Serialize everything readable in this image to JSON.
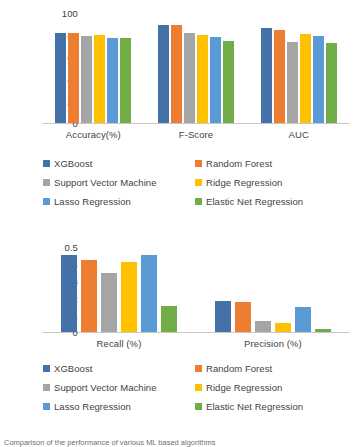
{
  "series_names": [
    "XGBoost",
    "Random Forest",
    "Support Vector Machine",
    "Ridge Regression",
    "Lasso Regression",
    "Elastic Net Regression"
  ],
  "colors": {
    "xgboost": "#4472a8",
    "random_forest": "#ed7d31",
    "support_vector_machine": "#a5a5a5",
    "ridge_regression": "#ffc000",
    "lasso_regression": "#5b9bd5",
    "elastic_net_regression": "#70ad47"
  },
  "caption": {
    "text": "Comparison of the performance of various ML based algorithms"
  },
  "chart_data": [
    {
      "type": "bar",
      "title": "",
      "xlabel": "",
      "ylabel": "",
      "ylim": [
        0,
        100
      ],
      "yticks": [
        "0",
        "20",
        "40",
        "60",
        "80",
        "100"
      ],
      "ytick_values": [
        0,
        20,
        40,
        60,
        80,
        100
      ],
      "grid": false,
      "legend_position": "bottom",
      "categories": [
        "Accuracy(%)",
        "F-Score",
        "AUC"
      ],
      "series": [
        {
          "name": "XGBoost",
          "color": "#4472a8",
          "values": [
            82,
            89.5,
            86.5
          ]
        },
        {
          "name": "Random Forest",
          "color": "#ed7d31",
          "values": [
            82,
            89,
            85
          ]
        },
        {
          "name": "Support Vector Machine",
          "color": "#a5a5a5",
          "values": [
            79,
            81.5,
            74
          ]
        },
        {
          "name": "Ridge Regression",
          "color": "#ffc000",
          "values": [
            80,
            80,
            80.5
          ]
        },
        {
          "name": "Lasso Regression",
          "color": "#5b9bd5",
          "values": [
            77,
            78.5,
            79.5
          ]
        },
        {
          "name": "Elastic Net Regression",
          "color": "#70ad47",
          "values": [
            77,
            75,
            72.5
          ]
        }
      ]
    },
    {
      "type": "bar",
      "title": "",
      "xlabel": "",
      "ylabel": "",
      "ylim": [
        0,
        0.5
      ],
      "yticks": [
        "0",
        "0.1",
        "0.2",
        "0.3",
        "0.4",
        "0.5"
      ],
      "ytick_values": [
        0,
        0.1,
        0.2,
        0.3,
        0.4,
        0.5
      ],
      "grid": false,
      "legend_position": "bottom",
      "categories": [
        "Recall (%)",
        "Precision (%)"
      ],
      "series": [
        {
          "name": "XGBoost",
          "color": "#4472a8",
          "values": [
            0.455,
            0.18
          ]
        },
        {
          "name": "Random Forest",
          "color": "#ed7d31",
          "values": [
            0.425,
            0.175
          ]
        },
        {
          "name": "Support Vector Machine",
          "color": "#a5a5a5",
          "values": [
            0.35,
            0.065
          ]
        },
        {
          "name": "Ridge Regression",
          "color": "#ffc000",
          "values": [
            0.41,
            0.055
          ]
        },
        {
          "name": "Lasso Regression",
          "color": "#5b9bd5",
          "values": [
            0.455,
            0.145
          ]
        },
        {
          "name": "Elastic Net Regression",
          "color": "#70ad47",
          "values": [
            0.155,
            0.015
          ]
        }
      ]
    }
  ]
}
